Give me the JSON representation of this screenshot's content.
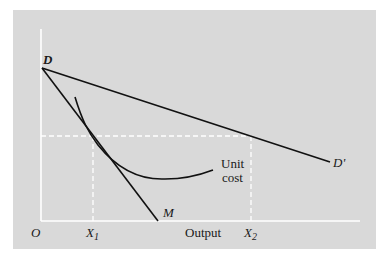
{
  "diagram": {
    "labels": {
      "origin": "O",
      "D": "D",
      "D_prime": "D'",
      "M": "M",
      "unit_cost_line1": "Unit",
      "unit_cost_line2": "cost",
      "x1": "X",
      "x1_sub": "1",
      "x2": "X",
      "x2_sub": "2",
      "x_axis": "Output"
    },
    "colors": {
      "panel": "#d9d9d9",
      "lines": "#111111",
      "axes": "#ffffff",
      "dashed": "#ffffff"
    }
  }
}
